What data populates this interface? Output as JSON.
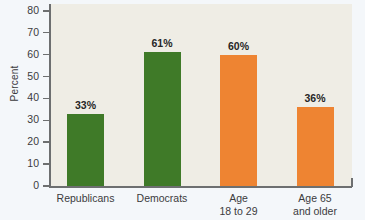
{
  "chart_data": {
    "type": "bar",
    "title": "",
    "subtitle": "",
    "xlabel": "",
    "ylabel": "Percent",
    "ylim": [
      0,
      80
    ],
    "yticks": [
      "0",
      "10",
      "20",
      "30",
      "40",
      "50",
      "60",
      "70",
      "80"
    ],
    "grid": false,
    "legend": "none",
    "categories": [
      "Republicans",
      "Democrats",
      "Age\n18 to 29",
      "Age 65\nand older"
    ],
    "values": [
      33,
      61,
      60,
      36
    ],
    "value_labels": [
      "33%",
      "61%",
      "60%",
      "36%"
    ],
    "bar_colors": [
      "#3f7a28",
      "#3f7a28",
      "#ee8432",
      "#ee8432"
    ],
    "colors": {
      "green": "#3f7a28",
      "orange": "#ee8432",
      "plot_background": "#efede5",
      "figure_background": "#f4f7fa",
      "axis": "#6d6f70",
      "text": "#3b3b3d",
      "value_text": "#262626"
    }
  }
}
